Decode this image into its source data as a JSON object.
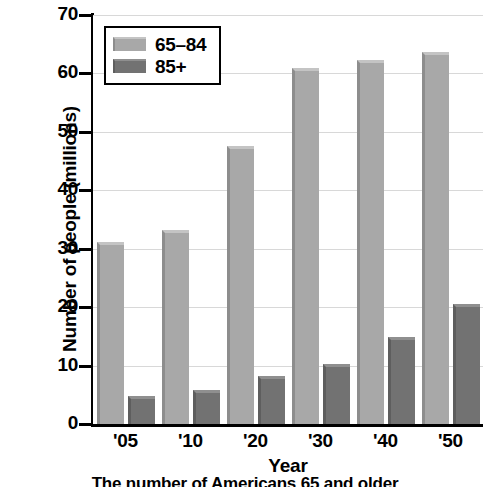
{
  "chart_data": {
    "type": "bar",
    "title": "",
    "caption": "The number of Americans 65 and older",
    "xlabel": "Year",
    "ylabel": "Number of people (millions)",
    "categories": [
      "'05",
      "'10",
      "'20",
      "'30",
      "'40",
      "'50"
    ],
    "series": [
      {
        "name": "65–84",
        "values": [
          31.2,
          33.2,
          47.6,
          61.0,
          62.3,
          63.6
        ],
        "color": "#a8a8a8"
      },
      {
        "name": "85+",
        "values": [
          4.8,
          5.9,
          8.3,
          10.2,
          14.9,
          20.6
        ],
        "color": "#727272"
      }
    ],
    "ylim": [
      0,
      70
    ],
    "yticks": [
      0,
      10,
      20,
      30,
      40,
      50,
      60,
      70
    ],
    "ytick_labels": [
      "0",
      "10",
      "20",
      "30",
      "40",
      "50",
      "60",
      "70"
    ],
    "grid": true,
    "grid_axis": "y",
    "legend_position": "upper-left",
    "legend_entries": [
      "65–84",
      "85+"
    ]
  }
}
